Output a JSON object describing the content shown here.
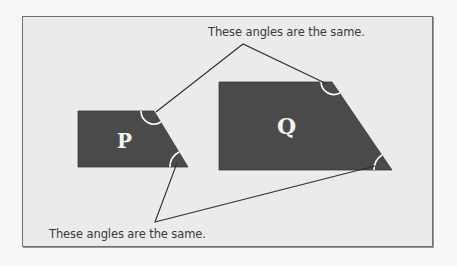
{
  "diagram": {
    "shapes": [
      {
        "id": "P",
        "label": "P",
        "fill": "#4a4a4a"
      },
      {
        "id": "Q",
        "label": "Q",
        "fill": "#4a4a4a"
      }
    ],
    "annotations": {
      "top": "These angles are the same.",
      "bottom": "These angles are the same."
    },
    "colors": {
      "panel_background": "#ebebeb",
      "panel_border": "#6f6f6f",
      "shape_fill": "#4a4a4a",
      "angle_arc": "#ffffff",
      "leader_line": "#2e2e2e",
      "text": "#3a3a3a"
    }
  }
}
